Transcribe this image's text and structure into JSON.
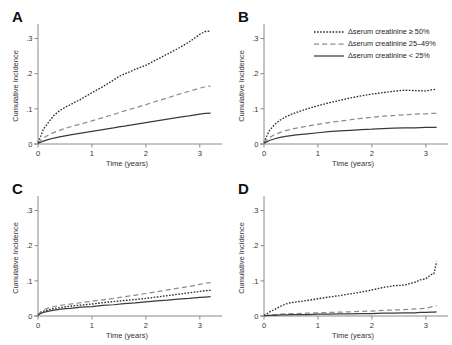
{
  "figure": {
    "title": "",
    "panel_letters": [
      "A",
      "B",
      "C",
      "D"
    ]
  },
  "legend": {
    "position": "top-right of panel B",
    "entries": [
      {
        "label": "Δserum creatinine ≥ 50%",
        "style": "dotted",
        "color": "#2b2b2b",
        "key": "ge50"
      },
      {
        "label": "Δserum creatinine 25–49%",
        "style": "dashed",
        "color": "#8d8d8d",
        "key": "mid"
      },
      {
        "label": "Δserum creatinine < 25%",
        "style": "solid",
        "color": "#3a3a3a",
        "key": "lt25"
      }
    ]
  },
  "axes": {
    "xlabel": "Time (years)",
    "ylabel": "Cumulative Incidence",
    "xticks": [
      "0",
      "1",
      "2",
      "3"
    ],
    "yticks": [
      "0",
      ".1",
      ".2",
      ".3"
    ],
    "xlim": [
      0,
      3.3
    ],
    "ylim": [
      0,
      0.33
    ],
    "grid": false
  },
  "chart_data": [
    {
      "type": "line",
      "panel": "A",
      "title": "A",
      "xlabel": "Time (years)",
      "ylabel": "Cumulative Incidence",
      "xlim": [
        0,
        3.3
      ],
      "ylim": [
        0,
        0.33
      ],
      "xticks": [
        0,
        1,
        2,
        3
      ],
      "yticks": [
        0,
        0.1,
        0.2,
        0.3
      ],
      "grid": false,
      "legend_position": "none",
      "x": [
        0,
        0.05,
        0.1,
        0.2,
        0.3,
        0.4,
        0.5,
        0.6,
        0.8,
        1.0,
        1.2,
        1.4,
        1.5,
        1.6,
        1.8,
        2.0,
        2.2,
        2.4,
        2.6,
        2.8,
        3.0,
        3.1,
        3.2
      ],
      "series": [
        {
          "name": "Δserum creatinine ≥ 50%",
          "style": "dotted",
          "values": [
            0.004,
            0.022,
            0.042,
            0.063,
            0.082,
            0.095,
            0.104,
            0.112,
            0.128,
            0.146,
            0.163,
            0.182,
            0.192,
            0.199,
            0.212,
            0.224,
            0.24,
            0.256,
            0.272,
            0.29,
            0.312,
            0.32,
            0.321
          ]
        },
        {
          "name": "Δserum creatinine 25–49%",
          "style": "dashed",
          "values": [
            0.003,
            0.01,
            0.017,
            0.026,
            0.033,
            0.039,
            0.044,
            0.049,
            0.057,
            0.066,
            0.075,
            0.084,
            0.089,
            0.094,
            0.103,
            0.112,
            0.122,
            0.131,
            0.141,
            0.15,
            0.159,
            0.163,
            0.165
          ]
        },
        {
          "name": "Δserum creatinine < 25%",
          "style": "solid",
          "values": [
            0.002,
            0.005,
            0.008,
            0.013,
            0.017,
            0.02,
            0.023,
            0.026,
            0.031,
            0.036,
            0.041,
            0.046,
            0.049,
            0.051,
            0.056,
            0.061,
            0.066,
            0.071,
            0.076,
            0.08,
            0.085,
            0.087,
            0.088
          ]
        }
      ]
    },
    {
      "type": "line",
      "panel": "B",
      "title": "B",
      "xlabel": "Time (years)",
      "ylabel": "Cumulative Incidence",
      "xlim": [
        0,
        3.3
      ],
      "ylim": [
        0,
        0.33
      ],
      "xticks": [
        0,
        1,
        2,
        3
      ],
      "yticks": [
        0,
        0.1,
        0.2,
        0.3
      ],
      "grid": false,
      "legend_position": "upper right",
      "x": [
        0,
        0.05,
        0.1,
        0.2,
        0.3,
        0.4,
        0.5,
        0.6,
        0.8,
        1.0,
        1.2,
        1.4,
        1.6,
        1.8,
        2.0,
        2.2,
        2.4,
        2.6,
        2.8,
        3.0,
        3.1,
        3.2
      ],
      "series": [
        {
          "name": "Δserum creatinine ≥ 50%",
          "style": "dotted",
          "values": [
            0.004,
            0.022,
            0.038,
            0.056,
            0.068,
            0.077,
            0.084,
            0.09,
            0.1,
            0.109,
            0.117,
            0.124,
            0.131,
            0.137,
            0.142,
            0.146,
            0.15,
            0.153,
            0.152,
            0.151,
            0.154,
            0.156
          ]
        },
        {
          "name": "Δserum creatinine 25–49%",
          "style": "dashed",
          "values": [
            0.003,
            0.011,
            0.018,
            0.027,
            0.033,
            0.038,
            0.042,
            0.045,
            0.051,
            0.056,
            0.061,
            0.065,
            0.069,
            0.073,
            0.076,
            0.079,
            0.081,
            0.083,
            0.085,
            0.086,
            0.087,
            0.087
          ]
        },
        {
          "name": "Δserum creatinine < 25%",
          "style": "solid",
          "values": [
            0.002,
            0.006,
            0.01,
            0.015,
            0.019,
            0.022,
            0.024,
            0.026,
            0.029,
            0.032,
            0.035,
            0.037,
            0.039,
            0.041,
            0.042,
            0.044,
            0.045,
            0.046,
            0.046,
            0.047,
            0.047,
            0.047
          ]
        }
      ]
    },
    {
      "type": "line",
      "panel": "C",
      "title": "C",
      "xlabel": "Time (years)",
      "ylabel": "Cumulative Incidence",
      "xlim": [
        0,
        3.3
      ],
      "ylim": [
        0,
        0.33
      ],
      "xticks": [
        0,
        1,
        2,
        3
      ],
      "yticks": [
        0,
        0.1,
        0.2,
        0.3
      ],
      "grid": false,
      "legend_position": "none",
      "x": [
        0,
        0.05,
        0.1,
        0.2,
        0.3,
        0.4,
        0.5,
        0.6,
        0.8,
        1.0,
        1.2,
        1.4,
        1.6,
        1.8,
        2.0,
        2.2,
        2.4,
        2.6,
        2.8,
        3.0,
        3.1,
        3.2
      ],
      "series": [
        {
          "name": "Δserum creatinine ≥ 50%",
          "style": "dotted",
          "values": [
            0.003,
            0.009,
            0.013,
            0.018,
            0.021,
            0.024,
            0.026,
            0.028,
            0.031,
            0.034,
            0.038,
            0.041,
            0.044,
            0.047,
            0.05,
            0.054,
            0.058,
            0.062,
            0.066,
            0.07,
            0.072,
            0.073
          ]
        },
        {
          "name": "Δserum creatinine 25–49%",
          "style": "dashed",
          "values": [
            0.004,
            0.012,
            0.017,
            0.023,
            0.027,
            0.03,
            0.032,
            0.034,
            0.038,
            0.042,
            0.046,
            0.05,
            0.055,
            0.059,
            0.064,
            0.069,
            0.074,
            0.079,
            0.084,
            0.09,
            0.093,
            0.095
          ]
        },
        {
          "name": "Δserum creatinine < 25%",
          "style": "solid",
          "values": [
            0.002,
            0.007,
            0.01,
            0.014,
            0.017,
            0.019,
            0.021,
            0.022,
            0.025,
            0.027,
            0.03,
            0.032,
            0.035,
            0.037,
            0.04,
            0.043,
            0.045,
            0.048,
            0.05,
            0.053,
            0.054,
            0.055
          ]
        }
      ]
    },
    {
      "type": "line",
      "panel": "D",
      "title": "D",
      "xlabel": "Time (years)",
      "ylabel": "Cumulative Incidence",
      "xlim": [
        0,
        3.3
      ],
      "ylim": [
        0,
        0.33
      ],
      "xticks": [
        0,
        1,
        2,
        3
      ],
      "yticks": [
        0,
        0.1,
        0.2,
        0.3
      ],
      "grid": false,
      "legend_position": "none",
      "x": [
        0,
        0.05,
        0.1,
        0.2,
        0.3,
        0.4,
        0.5,
        0.6,
        0.8,
        1.0,
        1.2,
        1.4,
        1.6,
        1.8,
        2.0,
        2.2,
        2.4,
        2.6,
        2.8,
        2.9,
        3.0,
        3.1,
        3.15,
        3.2
      ],
      "series": [
        {
          "name": "Δserum creatinine ≥ 50%",
          "style": "dotted",
          "values": [
            0.002,
            0.006,
            0.011,
            0.019,
            0.027,
            0.034,
            0.038,
            0.04,
            0.044,
            0.049,
            0.054,
            0.058,
            0.063,
            0.068,
            0.074,
            0.081,
            0.086,
            0.088,
            0.096,
            0.103,
            0.106,
            0.118,
            0.12,
            0.155
          ]
        },
        {
          "name": "Δserum creatinine 25–49%",
          "style": "dashed",
          "values": [
            0.001,
            0.002,
            0.003,
            0.004,
            0.005,
            0.006,
            0.007,
            0.007,
            0.008,
            0.009,
            0.01,
            0.011,
            0.012,
            0.013,
            0.014,
            0.016,
            0.017,
            0.018,
            0.02,
            0.021,
            0.022,
            0.026,
            0.028,
            0.029
          ]
        },
        {
          "name": "Δserum creatinine < 25%",
          "style": "solid",
          "values": [
            0.001,
            0.001,
            0.002,
            0.002,
            0.003,
            0.003,
            0.004,
            0.004,
            0.004,
            0.005,
            0.005,
            0.006,
            0.006,
            0.007,
            0.007,
            0.008,
            0.008,
            0.009,
            0.009,
            0.01,
            0.01,
            0.011,
            0.011,
            0.012
          ]
        }
      ]
    }
  ]
}
